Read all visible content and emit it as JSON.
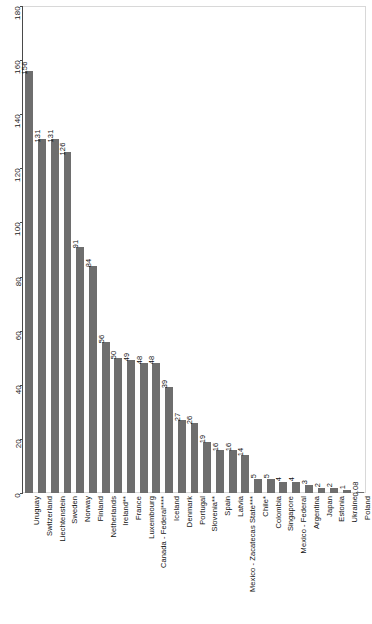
{
  "chart_data": {
    "type": "bar",
    "title": "",
    "subtitle": "",
    "xlabel": "",
    "ylabel": "",
    "ylim": [
      0,
      180
    ],
    "yticks": [
      0,
      20,
      40,
      60,
      80,
      100,
      120,
      140,
      160,
      180
    ],
    "grid": false,
    "legend": "none",
    "orientation": "vertical",
    "bar_color": "#6e6e6e",
    "background_color": "#ffffff",
    "label_rotation": -90,
    "categories": [
      "Uruguay",
      "Switzerland",
      "Liechtenstein",
      "Sweden",
      "Norway",
      "Finland",
      "Netherlands",
      "Ireland**",
      "France",
      "Luxembourg",
      "Canada - Federal****",
      "Iceland",
      "Denmark",
      "Portugal",
      "Slovenia**",
      "Spain",
      "Latvia",
      "Mexico - Zacatecas State***",
      "Chile*",
      "Colombia",
      "Singapore",
      "Mexico - Federal",
      "Argentina",
      "Japan",
      "Estonia",
      "Ukraine",
      "Poland"
    ],
    "values": [
      156,
      131,
      131,
      126,
      91,
      84,
      56,
      50,
      49,
      48,
      48,
      39,
      27,
      26,
      19,
      16,
      16,
      14,
      5,
      5,
      4,
      4,
      3,
      2,
      2,
      1,
      0.08
    ],
    "value_labels": [
      "156",
      "131",
      "131",
      "126",
      "91",
      "84",
      "56",
      "50",
      "49",
      "48",
      "48",
      "39",
      "27",
      "26",
      "19",
      "16",
      "16",
      "14",
      "5",
      "5",
      "4",
      "4",
      "3",
      "2",
      "2",
      "1",
      "0.08"
    ]
  }
}
